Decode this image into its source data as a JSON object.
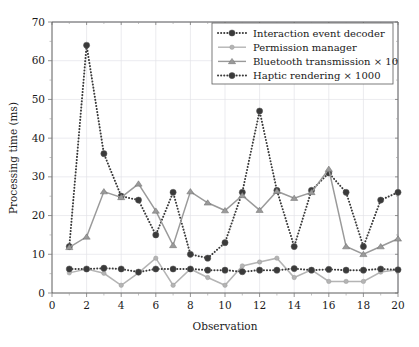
{
  "chart_data": {
    "type": "line",
    "title": "",
    "xlabel": "Observation",
    "ylabel": "Processing time (ms)",
    "xlim": [
      0,
      20
    ],
    "ylim": [
      0,
      70
    ],
    "xticks": [
      0,
      2,
      4,
      6,
      8,
      10,
      12,
      14,
      16,
      18,
      20
    ],
    "yticks": [
      0,
      10,
      20,
      30,
      40,
      50,
      60,
      70
    ],
    "grid": true,
    "legend_position": "top-right",
    "x": [
      1,
      2,
      3,
      4,
      5,
      6,
      7,
      8,
      9,
      10,
      11,
      12,
      13,
      14,
      15,
      16,
      17,
      18,
      19,
      20
    ],
    "series": [
      {
        "name": "Interaction event decoder",
        "color": "#3a3a3a",
        "linestyle": "dotted",
        "marker": "circle",
        "values": [
          12,
          64,
          36,
          25,
          24,
          15,
          26,
          10,
          9,
          13,
          26,
          47,
          26.5,
          12,
          26.5,
          31,
          26,
          12,
          24,
          26
        ]
      },
      {
        "name": "Permission manager",
        "color": "#b4b4b4",
        "linestyle": "solid",
        "marker": "circle",
        "values": [
          5.2,
          6.2,
          5.1,
          2,
          5.2,
          9,
          2,
          6.2,
          4,
          2,
          7,
          8,
          9,
          4,
          6,
          3,
          3,
          3,
          5.4,
          6
        ]
      },
      {
        "name": "Bluetooth transmission × 10",
        "color": "#9a9a9a",
        "linestyle": "solid",
        "marker": "triangle",
        "values": [
          11.8,
          14.5,
          26.2,
          24.7,
          28.2,
          21.2,
          12.3,
          26.2,
          23.3,
          21.3,
          25.2,
          21.4,
          26.3,
          24.5,
          26,
          32,
          12,
          10,
          12,
          14
        ]
      },
      {
        "name": "Haptic rendering × 1000",
        "color": "#3a3a3a",
        "linestyle": "dotted",
        "marker": "circle",
        "values": [
          6.2,
          6.2,
          6.4,
          6.2,
          5.4,
          6.2,
          6.2,
          6.2,
          5.9,
          5.9,
          5.5,
          5.9,
          5.9,
          6.3,
          5.9,
          6.1,
          5.9,
          5.9,
          6.2,
          6
        ]
      }
    ]
  },
  "axes": {
    "xlabel": "Observation",
    "ylabel": "Processing time (ms)"
  },
  "legend": {
    "items": [
      {
        "label": "Interaction event decoder"
      },
      {
        "label": "Permission manager"
      },
      {
        "label": "Bluetooth transmission × 10"
      },
      {
        "label": "Haptic rendering × 1000"
      }
    ]
  }
}
